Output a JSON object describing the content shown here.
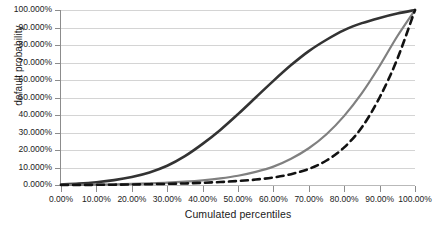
{
  "chart_data": {
    "type": "line",
    "title": "",
    "xlabel": "Cumulated percentiles",
    "ylabel": "default probability",
    "xlim": [
      0,
      100
    ],
    "ylim": [
      0,
      100
    ],
    "grid": "horizontal",
    "legend": "none",
    "x_tick_labels": [
      "0.00%",
      "10.00%",
      "20.00%",
      "30.00%",
      "40.00%",
      "50.00%",
      "60.00%",
      "70.00%",
      "80.00%",
      "90.00%",
      "100.00%"
    ],
    "x_tick_values": [
      0,
      10,
      20,
      30,
      40,
      50,
      60,
      70,
      80,
      90,
      100
    ],
    "y_tick_labels": [
      "0.000%",
      "10.000%",
      "20.000%",
      "30.000%",
      "40.000%",
      "50.000%",
      "60.000%",
      "70.000%",
      "80.000%",
      "90.000%",
      "100.000%"
    ],
    "y_tick_values": [
      0,
      10,
      20,
      30,
      40,
      50,
      60,
      70,
      80,
      90,
      100
    ],
    "x": [
      0,
      5,
      10,
      15,
      20,
      25,
      30,
      35,
      40,
      45,
      50,
      55,
      60,
      65,
      70,
      75,
      80,
      85,
      90,
      95,
      100
    ],
    "series": [
      {
        "name": "curve-dark-solid",
        "color": "#333333",
        "style": "solid",
        "width": 2.6,
        "values": [
          0.3,
          0.8,
          1.6,
          2.8,
          4.6,
          7.2,
          11.0,
          16.5,
          23.5,
          31.5,
          40.5,
          50.0,
          59.5,
          68.5,
          76.5,
          83.0,
          88.5,
          92.5,
          95.5,
          98.0,
          100.0
        ]
      },
      {
        "name": "curve-gray-solid",
        "color": "#808080",
        "style": "solid",
        "width": 2.2,
        "values": [
          0.05,
          0.1,
          0.2,
          0.35,
          0.6,
          0.9,
          1.3,
          1.9,
          2.7,
          3.8,
          5.3,
          7.5,
          10.5,
          15.0,
          21.0,
          29.0,
          39.5,
          52.5,
          68.0,
          85.0,
          100.0
        ]
      },
      {
        "name": "curve-black-dashed",
        "color": "#121212",
        "style": "dashed",
        "width": 2.6,
        "values": [
          0.02,
          0.05,
          0.1,
          0.18,
          0.3,
          0.45,
          0.65,
          0.9,
          1.25,
          1.7,
          2.3,
          3.1,
          4.3,
          6.2,
          9.2,
          14.0,
          21.5,
          33.0,
          50.0,
          72.0,
          100.0
        ]
      }
    ]
  }
}
